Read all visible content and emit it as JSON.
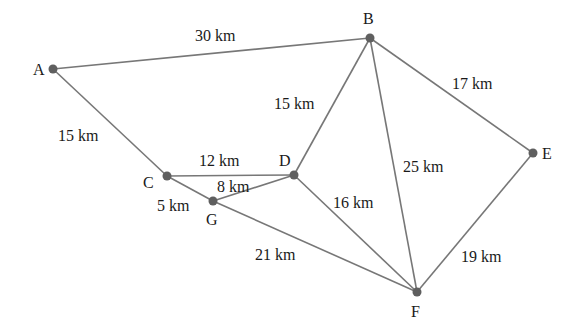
{
  "diagram": {
    "type": "weighted-undirected-graph",
    "unit": "km",
    "colors": {
      "edge": "#777777",
      "node": "#5f5f5f",
      "text": "#1a1a1a"
    },
    "nodes": [
      {
        "id": "A",
        "label": "A",
        "x": 53,
        "y": 69,
        "lx": 33,
        "ly": 75
      },
      {
        "id": "B",
        "label": "B",
        "x": 370,
        "y": 38,
        "lx": 363,
        "ly": 24
      },
      {
        "id": "C",
        "label": "C",
        "x": 167,
        "y": 176,
        "lx": 143,
        "ly": 188
      },
      {
        "id": "D",
        "label": "D",
        "x": 294,
        "y": 175,
        "lx": 279,
        "ly": 166
      },
      {
        "id": "G",
        "label": "G",
        "x": 213,
        "y": 201,
        "lx": 206,
        "ly": 225
      },
      {
        "id": "E",
        "label": "E",
        "x": 533,
        "y": 153,
        "lx": 542,
        "ly": 159
      },
      {
        "id": "F",
        "label": "F",
        "x": 417,
        "y": 292,
        "lx": 411,
        "ly": 317
      }
    ],
    "edges": [
      {
        "from": "A",
        "to": "B",
        "weight": "30 km",
        "lx": 195,
        "ly": 41
      },
      {
        "from": "A",
        "to": "C",
        "weight": "15 km",
        "lx": 58,
        "ly": 141
      },
      {
        "from": "B",
        "to": "D",
        "weight": "15 km",
        "lx": 274,
        "ly": 109
      },
      {
        "from": "B",
        "to": "E",
        "weight": "17 km",
        "lx": 452,
        "ly": 89
      },
      {
        "from": "B",
        "to": "F",
        "weight": "25 km",
        "lx": 403,
        "ly": 172
      },
      {
        "from": "C",
        "to": "D",
        "weight": "12 km",
        "lx": 199,
        "ly": 166
      },
      {
        "from": "G",
        "to": "D",
        "weight": "8 km",
        "lx": 217,
        "ly": 192
      },
      {
        "from": "C",
        "to": "G",
        "weight": "5 km",
        "lx": 157,
        "ly": 211
      },
      {
        "from": "D",
        "to": "F",
        "weight": "16 km",
        "lx": 333,
        "ly": 208
      },
      {
        "from": "G",
        "to": "F",
        "weight": "21 km",
        "lx": 255,
        "ly": 260
      },
      {
        "from": "E",
        "to": "F",
        "weight": "19 km",
        "lx": 461,
        "ly": 262
      }
    ]
  }
}
